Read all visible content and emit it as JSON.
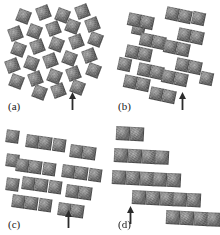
{
  "figure": {
    "background_color": "#ffffff",
    "width": 220,
    "height": 235,
    "panel_count": 4,
    "layout": "2x2 grid"
  },
  "style": {
    "tile_fill_light": "#9a9a9a",
    "tile_fill_mid": "#808080",
    "tile_fill_dark": "#6a6a6a",
    "tile_edge_color": "#282828",
    "label_color": "#1a1a1a",
    "arrow_color": "#2b2b2b",
    "background_color": "#ffffff"
  },
  "panels": [
    {
      "id": "a",
      "label": "(a)",
      "caption_text": "(a)",
      "state": "open rotating-squares lattice, fully expanded",
      "arrow": {
        "present": true,
        "direction": "up",
        "x": 68,
        "y": 92,
        "label": "reference marker"
      },
      "tile_size": 13.4,
      "rotation_deg": 21,
      "tiles": [
        {
          "x": 17,
          "y": 10,
          "r": 21
        },
        {
          "x": 37,
          "y": 6,
          "r": -21
        },
        {
          "x": 56,
          "y": 9,
          "r": 21
        },
        {
          "x": 76,
          "y": 5,
          "r": -21
        },
        {
          "x": 9,
          "y": 27,
          "r": -21
        },
        {
          "x": 28,
          "y": 25,
          "r": 21
        },
        {
          "x": 47,
          "y": 22,
          "r": -21
        },
        {
          "x": 66,
          "y": 20,
          "r": 21
        },
        {
          "x": 86,
          "y": 18,
          "r": -21
        },
        {
          "x": 12,
          "y": 43,
          "r": 21
        },
        {
          "x": 31,
          "y": 40,
          "r": -21
        },
        {
          "x": 50,
          "y": 38,
          "r": 21
        },
        {
          "x": 70,
          "y": 35,
          "r": -21
        },
        {
          "x": 89,
          "y": 33,
          "r": 21
        },
        {
          "x": 6,
          "y": 59,
          "r": -21
        },
        {
          "x": 25,
          "y": 57,
          "r": 21
        },
        {
          "x": 44,
          "y": 54,
          "r": -21
        },
        {
          "x": 63,
          "y": 52,
          "r": 21
        },
        {
          "x": 83,
          "y": 49,
          "r": -21
        },
        {
          "x": 10,
          "y": 75,
          "r": 21
        },
        {
          "x": 29,
          "y": 72,
          "r": -21
        },
        {
          "x": 48,
          "y": 70,
          "r": 21
        },
        {
          "x": 67,
          "y": 67,
          "r": -21
        },
        {
          "x": 87,
          "y": 64,
          "r": 21
        },
        {
          "x": 33,
          "y": 86,
          "r": 21
        },
        {
          "x": 52,
          "y": 84,
          "r": -21
        },
        {
          "x": 71,
          "y": 81,
          "r": 21
        }
      ],
      "chains": []
    },
    {
      "id": "b",
      "label": "(b)",
      "caption_text": "(b)",
      "state": "partially collapsed, squares paired into 2-tile chains",
      "arrow": {
        "present": true,
        "direction": "up",
        "x": 68,
        "y": 92,
        "label": "reference marker"
      },
      "tile_size": 13.4,
      "rotation_deg": 12,
      "tiles": [
        {
          "x": 22,
          "y": 22,
          "r": 12
        },
        {
          "x": 82,
          "y": 12,
          "r": 12
        },
        {
          "x": 8,
          "y": 58,
          "r": 12
        },
        {
          "x": 90,
          "y": 72,
          "r": 12
        }
      ],
      "chains": [
        {
          "x": 18,
          "y": 12,
          "n": 2,
          "r": 12
        },
        {
          "x": 56,
          "y": 6,
          "n": 2,
          "r": 12
        },
        {
          "x": 30,
          "y": 32,
          "n": 2,
          "r": 12
        },
        {
          "x": 68,
          "y": 27,
          "n": 2,
          "r": 12
        },
        {
          "x": 16,
          "y": 44,
          "n": 2,
          "r": 12
        },
        {
          "x": 54,
          "y": 39,
          "n": 2,
          "r": 12
        },
        {
          "x": 28,
          "y": 62,
          "n": 2,
          "r": 12
        },
        {
          "x": 66,
          "y": 57,
          "n": 2,
          "r": 12
        },
        {
          "x": 14,
          "y": 74,
          "n": 2,
          "r": 12
        },
        {
          "x": 52,
          "y": 69,
          "n": 2,
          "r": 12
        },
        {
          "x": 40,
          "y": 86,
          "n": 2,
          "r": 12
        }
      ]
    },
    {
      "id": "c",
      "label": "(c)",
      "caption_text": "(c)",
      "state": "further collapsed, squares merged into 3-tile chains",
      "arrow": {
        "present": true,
        "direction": "up",
        "x": 64,
        "y": 92,
        "label": "reference marker"
      },
      "tile_size": 13.4,
      "rotation_deg": 8,
      "tiles": [
        {
          "x": 6,
          "y": 12,
          "r": 8
        },
        {
          "x": 6,
          "y": 36,
          "r": 8
        },
        {
          "x": 6,
          "y": 60,
          "r": 8
        }
      ],
      "chains": [
        {
          "x": 26,
          "y": 16,
          "n": 3,
          "r": 8
        },
        {
          "x": 70,
          "y": 26,
          "n": 2,
          "r": 8
        },
        {
          "x": 16,
          "y": 40,
          "n": 3,
          "r": 8
        },
        {
          "x": 62,
          "y": 46,
          "n": 3,
          "r": 8
        },
        {
          "x": 22,
          "y": 58,
          "n": 3,
          "r": 8
        },
        {
          "x": 66,
          "y": 66,
          "n": 2,
          "r": 8
        },
        {
          "x": 12,
          "y": 76,
          "n": 3,
          "r": 8
        },
        {
          "x": 58,
          "y": 84,
          "n": 2,
          "r": 8
        }
      ]
    },
    {
      "id": "d",
      "label": "(d)",
      "caption_text": "(d)",
      "state": "fully collapsed, long horizontal chains in staircase arrangement",
      "arrow": {
        "present": true,
        "direction": "up",
        "x": 16,
        "y": 88,
        "label": "reference marker"
      },
      "tile_size": 13.8,
      "rotation_deg": 3,
      "tiles": [],
      "chains": [
        {
          "x": 6,
          "y": 8,
          "n": 2,
          "r": 3
        },
        {
          "x": 4,
          "y": 30,
          "n": 4,
          "r": 3
        },
        {
          "x": 2,
          "y": 52,
          "n": 5,
          "r": 3
        },
        {
          "x": 22,
          "y": 72,
          "n": 5,
          "r": 3
        },
        {
          "x": 56,
          "y": 92,
          "n": 4,
          "r": 3
        }
      ]
    }
  ]
}
